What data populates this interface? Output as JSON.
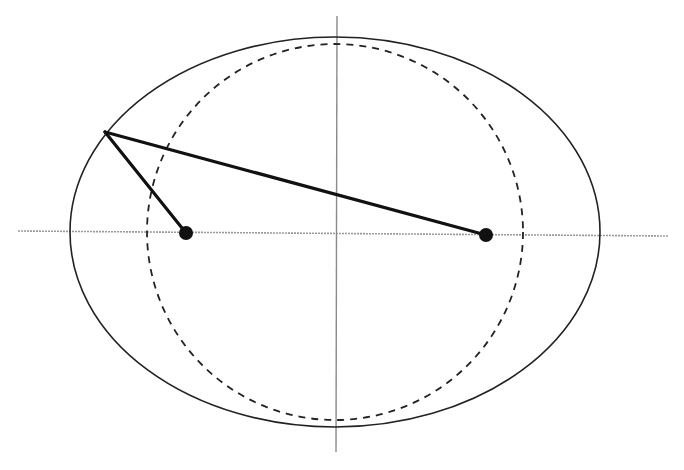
{
  "diagram": {
    "type": "ellipse-foci-construction",
    "canvas": {
      "width": 684,
      "height": 470,
      "background": "#ffffff"
    },
    "axes": {
      "horizontal": {
        "x1": 18,
        "y1": 231,
        "x2": 668,
        "y2": 236,
        "color": "#9a9a9a",
        "width": 1.6
      },
      "vertical": {
        "x1": 337,
        "y1": 16,
        "x2": 336,
        "y2": 452,
        "color": "#8a8a8a",
        "width": 1.4
      }
    },
    "ellipse": {
      "cx": 335,
      "cy": 232,
      "rx": 265,
      "ry": 195,
      "stroke": "#222222",
      "width": 1.6,
      "style": "solid"
    },
    "circle": {
      "cx": 335,
      "cy": 232,
      "r": 188,
      "stroke": "#222222",
      "width": 1.8,
      "style": "dashed",
      "dash": "7 6"
    },
    "point_on_ellipse": {
      "x": 105,
      "y": 132
    },
    "foci": [
      {
        "label": "",
        "x": 186,
        "y": 233,
        "r": 7
      },
      {
        "label": "",
        "x": 486,
        "y": 235,
        "r": 7
      }
    ],
    "segments": [
      {
        "from": "point_on_ellipse",
        "to": "focus_1",
        "width": 3.2,
        "color": "#111111"
      },
      {
        "from": "point_on_ellipse",
        "to": "focus_2",
        "width": 3.2,
        "color": "#111111"
      }
    ]
  }
}
